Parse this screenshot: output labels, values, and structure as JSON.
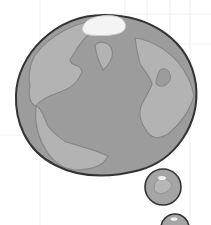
{
  "illustration": {
    "subject": "globe thought bubble",
    "colors": {
      "background": "#ffffff",
      "grid": "#eeeeee",
      "ocean": "#9c9c9c",
      "land": "#b3b3b3",
      "coastline": "#878787",
      "ice_cap": "#f4f4f4",
      "outline": "#333333",
      "highlight": "#f0f0f0"
    },
    "bubbles": [
      {
        "name": "small-bubble-1",
        "cx": 163,
        "cy": 187,
        "r": 18
      },
      {
        "name": "small-bubble-2",
        "cx": 175,
        "cy": 226,
        "r": 14
      }
    ]
  }
}
